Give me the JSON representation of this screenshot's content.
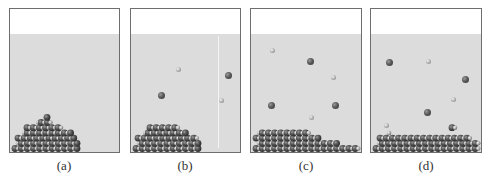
{
  "figure": {
    "panels": [
      {
        "id": "a",
        "label": "(a)",
        "description": "Crystal solid at bottom of solvent, no dissolved ions",
        "pile": "tall",
        "ions": []
      },
      {
        "id": "b",
        "label": "(b)",
        "description": "Crystal beginning to dissolve, few ions in solution",
        "pile": "medium",
        "ions": [
          {
            "type": "small",
            "x": 47,
            "y": 60
          },
          {
            "type": "large",
            "x": 97,
            "y": 66
          },
          {
            "type": "large",
            "x": 30,
            "y": 86
          },
          {
            "type": "small",
            "x": 90,
            "y": 91
          }
        ]
      },
      {
        "id": "c",
        "label": "(c)",
        "description": "More ions dissolved, crystal smaller",
        "pile": "low",
        "ions": [
          {
            "type": "small",
            "x": 21,
            "y": 41
          },
          {
            "type": "large",
            "x": 59,
            "y": 52
          },
          {
            "type": "small",
            "x": 82,
            "y": 68
          },
          {
            "type": "large",
            "x": 20,
            "y": 96
          },
          {
            "type": "large",
            "x": 84,
            "y": 96
          },
          {
            "type": "small",
            "x": 60,
            "y": 108
          }
        ]
      },
      {
        "id": "d",
        "label": "(d)",
        "description": "Dynamic equilibrium: ions dissolving and recrystallizing",
        "pile": "equilibrium",
        "ions": [
          {
            "type": "large",
            "x": 18,
            "y": 53
          },
          {
            "type": "small",
            "x": 57,
            "y": 52
          },
          {
            "type": "large",
            "x": 94,
            "y": 70
          },
          {
            "type": "small",
            "x": 82,
            "y": 90
          },
          {
            "type": "large",
            "x": 56,
            "y": 103
          },
          {
            "type": "small",
            "x": 15,
            "y": 116
          }
        ]
      }
    ],
    "colors": {
      "liquid": "#dcdcdc",
      "border": "#6e6e6e",
      "large_ion": "#444444",
      "small_ion": "#b8b8b8"
    }
  }
}
